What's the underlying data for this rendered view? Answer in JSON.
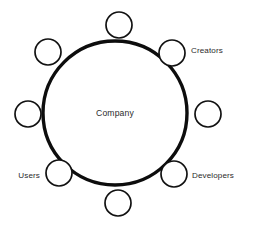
{
  "diagram": {
    "type": "hub-and-spoke-ring",
    "background_color": "#ffffff",
    "stroke_color": "#0d0d0d",
    "text_color": "#2b2b2b",
    "hub": {
      "label": "Company",
      "center_x": 115,
      "center_y": 113,
      "radius": 72,
      "stroke_width": 3.4,
      "fill": "#ffffff"
    },
    "node_style": {
      "radius": 13,
      "stroke_width": 1.7,
      "fill": "#ffffff",
      "stroke": "#111111"
    },
    "nodes": [
      {
        "id": "node-top",
        "label": "",
        "angle_deg": 270,
        "cx": 119,
        "cy": 25,
        "label_x": 0,
        "label_y": 0,
        "label_anchor": "none"
      },
      {
        "id": "node-top-right",
        "label": "Creators",
        "angle_deg": 315,
        "cx": 172,
        "cy": 53,
        "label_x": 191,
        "label_y": 51,
        "label_anchor": "start"
      },
      {
        "id": "node-right",
        "label": "",
        "angle_deg": 0,
        "cx": 208,
        "cy": 114,
        "label_x": 0,
        "label_y": 0,
        "label_anchor": "none"
      },
      {
        "id": "node-bottom-right",
        "label": "Developers",
        "angle_deg": 45,
        "cx": 174,
        "cy": 174,
        "label_x": 192,
        "label_y": 176,
        "label_anchor": "start"
      },
      {
        "id": "node-bottom",
        "label": "",
        "angle_deg": 90,
        "cx": 118,
        "cy": 203,
        "label_x": 0,
        "label_y": 0,
        "label_anchor": "none"
      },
      {
        "id": "node-bottom-left",
        "label": "Users",
        "angle_deg": 135,
        "cx": 59,
        "cy": 173,
        "label_x": 40,
        "label_y": 176,
        "label_anchor": "end"
      },
      {
        "id": "node-left",
        "label": "",
        "angle_deg": 180,
        "cx": 28,
        "cy": 114,
        "label_x": 0,
        "label_y": 0,
        "label_anchor": "none"
      },
      {
        "id": "node-top-left",
        "label": "",
        "angle_deg": 225,
        "cx": 48,
        "cy": 52,
        "label_x": 0,
        "label_y": 0,
        "label_anchor": "none"
      }
    ]
  }
}
